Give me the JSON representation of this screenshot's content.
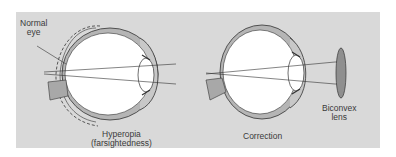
{
  "figure": {
    "background_color": "#d9d9d9",
    "eye_fill": "#ffffff",
    "sclera_fill": "#b5b5b5",
    "lens_fill": "#9a9a9a",
    "line_color": "#333333"
  },
  "left_panel": {
    "label_normal_line1": "Normal",
    "label_normal_line2": "eye",
    "caption_line1": "Hyperopia",
    "caption_line2": "(farsightedness)"
  },
  "right_panel": {
    "caption": "Correction",
    "lens_label_line1": "Biconvex",
    "lens_label_line2": "lens"
  }
}
